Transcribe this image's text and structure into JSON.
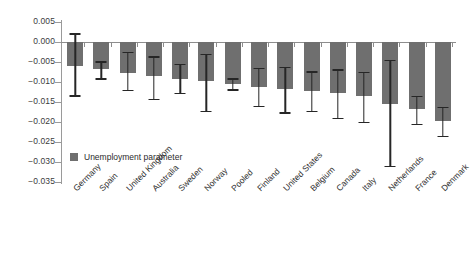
{
  "chart_data": {
    "type": "bar",
    "title": "",
    "xlabel": "",
    "ylabel": "",
    "ylim": [
      -0.035,
      0.005
    ],
    "ytick_step": 0.005,
    "grid": false,
    "legend_position": "inside-lower-left",
    "orientation": "vertical",
    "error_bars": true,
    "bar_color": "#6f6f6f",
    "error_bar_color": "#262626",
    "yticks": [
      "0.005",
      "0.000",
      "-0.005",
      "-0.010",
      "-0.015",
      "-0.020",
      "-0.025",
      "-0.030",
      "-0.035"
    ],
    "ytick_values": [
      0.005,
      0.0,
      -0.005,
      -0.01,
      -0.015,
      -0.02,
      -0.025,
      -0.03,
      -0.035
    ],
    "categories": [
      "Germany",
      "Spain",
      "United Kingdom",
      "Australia",
      "Sweden",
      "Norway",
      "Pooled",
      "Finland",
      "United States",
      "Belgium",
      "Canada",
      "Italy",
      "Netherlands",
      "France",
      "Denmark"
    ],
    "series": [
      {
        "name": "Unemployment parameter",
        "values": [
          -0.006,
          -0.0068,
          -0.0078,
          -0.0085,
          -0.0093,
          -0.0098,
          -0.0105,
          -0.0112,
          -0.0118,
          -0.0122,
          -0.0128,
          -0.0135,
          -0.0155,
          -0.0168,
          -0.0198
        ],
        "error_low": [
          -0.0133,
          -0.0091,
          -0.0119,
          -0.0142,
          -0.0127,
          -0.0172,
          -0.0118,
          -0.016,
          -0.0176,
          -0.0172,
          -0.019,
          -0.0199,
          -0.031,
          -0.0205,
          -0.0235
        ],
        "error_high": [
          0.0022,
          -0.0048,
          -0.0024,
          -0.0036,
          -0.0055,
          -0.0029,
          -0.0091,
          -0.0065,
          -0.0062,
          -0.0073,
          -0.0068,
          -0.0075,
          -0.0045,
          -0.0134,
          -0.0162
        ]
      }
    ],
    "legend": [
      "Unemployment parameter"
    ]
  },
  "legend": {
    "label": "Unemployment parameter",
    "swatch_color": "#6f6f6f"
  }
}
